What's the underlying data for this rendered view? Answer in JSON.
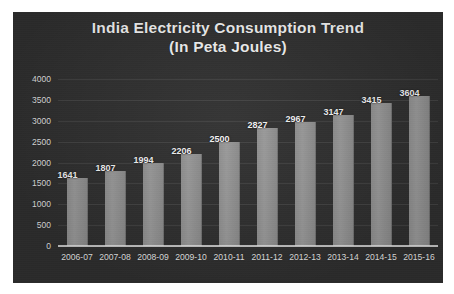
{
  "chart_data": {
    "type": "bar",
    "title": "India Electricity Consumption Trend",
    "subtitle": "(In Peta Joules)",
    "xlabel": "",
    "ylabel": "",
    "categories": [
      "2006-07",
      "2007-08",
      "2008-09",
      "2009-10",
      "2010-11",
      "2011-12",
      "2012-13",
      "2013-14",
      "2014-15",
      "2015-16"
    ],
    "values": [
      1641,
      1807,
      1994,
      2206,
      2500,
      2827,
      2967,
      3147,
      3415,
      3604
    ],
    "ylim": [
      0,
      4000
    ],
    "yticks": [
      0,
      500,
      1000,
      1500,
      2000,
      2500,
      3000,
      3500,
      4000
    ],
    "ytick_labels": [
      "0",
      "500",
      "1000",
      "1500",
      "2000",
      "2500",
      "3000",
      "3500",
      "4000"
    ],
    "grid": true,
    "legend": false,
    "data_labels": true,
    "colors": {
      "background": "#2f2f2f",
      "bar": "#8f8f8f",
      "text": "#f2f2f2",
      "gridline": "#4a4a4a",
      "axis": "#ebebeb"
    }
  }
}
